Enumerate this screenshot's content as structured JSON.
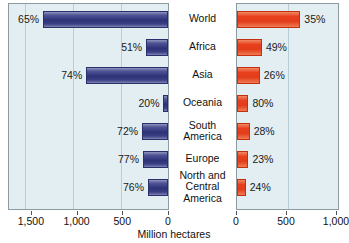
{
  "chart_data": {
    "type": "bar",
    "title": "",
    "xlabel": "Million hectares",
    "ylabel": "",
    "orientation": "horizontal",
    "layout": "back-to-back paired panels, left panel axis reversed",
    "grid": true,
    "legend": "none",
    "categories": [
      "World",
      "Africa",
      "Asia",
      "Oceania",
      "South\nAmerica",
      "Europe",
      "North and\nCentral\nAmerica"
    ],
    "panels": [
      {
        "name": "left-panel",
        "color": "#2d3277",
        "direction": "right-to-left",
        "xlim": [
          0,
          1750
        ],
        "ticks": [
          1500,
          1000,
          500,
          0
        ],
        "tick_labels": [
          "1,500",
          "1,000",
          "500",
          "0"
        ],
        "values": [
          1375,
          240,
          900,
          50,
          285,
          275,
          220
        ],
        "data_labels": [
          "65%",
          "51%",
          "74%",
          "20%",
          "72%",
          "77%",
          "76%"
        ]
      },
      {
        "name": "right-panel",
        "color": "#e8401f",
        "direction": "left-to-right",
        "xlim": [
          0,
          1020
        ],
        "ticks": [
          0,
          500,
          1000
        ],
        "tick_labels": [
          "0",
          "500",
          "1,000"
        ],
        "values": [
          640,
          252,
          230,
          115,
          128,
          115,
          88
        ],
        "data_labels": [
          "35%",
          "49%",
          "26%",
          "80%",
          "28%",
          "23%",
          "24%"
        ]
      }
    ]
  },
  "colors": {
    "panel_background": "#e3eef2",
    "panel_border": "#8d9aa0",
    "gridline": "#b9cdd6",
    "blue_bar": "#2d3277",
    "red_bar": "#e8401f",
    "text": "#111111"
  }
}
